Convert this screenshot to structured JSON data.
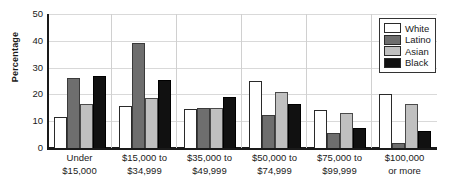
{
  "chart_data": {
    "type": "bar",
    "title": "",
    "xlabel": "",
    "ylabel": "Percentage",
    "ylim": [
      0,
      50
    ],
    "yticks": [
      50,
      40,
      30,
      20,
      10,
      0
    ],
    "grid": true,
    "legend_position": "top-right",
    "categories": [
      "Under\n$15,000",
      "$15,000 to\n$34,999",
      "$35,000 to\n$49,999",
      "$50,000 to\n$74,999",
      "$75,000 to\n$99,999",
      "$100,000\nor more"
    ],
    "category_lines": [
      [
        "Under",
        "$15,000"
      ],
      [
        "$15,000 to",
        "$34,999"
      ],
      [
        "$35,000 to",
        "$49,999"
      ],
      [
        "$50,000 to",
        "$74,999"
      ],
      [
        "$75,000 to",
        "$99,999"
      ],
      [
        "$100,000",
        "or more"
      ]
    ],
    "series": [
      {
        "name": "White",
        "color": "#ffffff",
        "values": [
          11.5,
          15.5,
          14.5,
          25.0,
          14.0,
          20.0
        ]
      },
      {
        "name": "Latino",
        "color": "#6e6e6e",
        "values": [
          26.0,
          39.0,
          15.0,
          12.5,
          5.5,
          2.0
        ]
      },
      {
        "name": "Asian",
        "color": "#c0c0c0",
        "values": [
          16.5,
          18.5,
          15.0,
          21.0,
          13.0,
          16.5
        ]
      },
      {
        "name": "Black",
        "color": "#111111",
        "values": [
          27.0,
          25.5,
          19.0,
          16.5,
          7.5,
          6.5
        ]
      }
    ]
  },
  "legend": {
    "items": [
      {
        "label": "White"
      },
      {
        "label": "Latino"
      },
      {
        "label": "Asian"
      },
      {
        "label": "Black"
      }
    ]
  }
}
